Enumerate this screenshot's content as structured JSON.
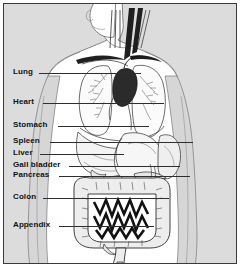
{
  "figure": {
    "background_color": "#dcdcdc",
    "body_color": "#ffffff",
    "line_color": "#2e2e2e",
    "border_color": "#3a3a3a",
    "organ_shade": "#f2f2f2",
    "heart_color": "#2b2b2b"
  },
  "labels": [
    {
      "name": "lung",
      "text": "Lung",
      "x": 12,
      "y": 67,
      "leader_start": 38,
      "leader_end": 140,
      "leader_y": 72
    },
    {
      "name": "heart",
      "text": "Heart",
      "x": 12,
      "y": 97,
      "leader_start": 42,
      "leader_end": 163,
      "leader_y": 102
    },
    {
      "name": "stomach",
      "text": "Stomach",
      "x": 12,
      "y": 120,
      "leader_start": 57,
      "leader_end": 148,
      "leader_y": 125
    },
    {
      "name": "spleen",
      "text": "Spleen",
      "x": 12,
      "y": 136,
      "leader_start": 49,
      "leader_end": 192,
      "leader_y": 141
    },
    {
      "name": "liver",
      "text": "Liver",
      "x": 12,
      "y": 148,
      "leader_start": 39,
      "leader_end": 120,
      "leader_y": 153
    },
    {
      "name": "gall-bladder",
      "text": "Gall bladder",
      "x": 12,
      "y": 160,
      "leader_start": 68,
      "leader_end": 176,
      "leader_y": 165
    },
    {
      "name": "pancreas",
      "text": "Pancreas",
      "x": 12,
      "y": 170,
      "leader_start": 58,
      "leader_end": 186,
      "leader_y": 175
    },
    {
      "name": "colon",
      "text": "Colon",
      "x": 12,
      "y": 192,
      "leader_start": 42,
      "leader_end": 165,
      "leader_y": 197
    },
    {
      "name": "appendix",
      "text": "Appendix",
      "x": 12,
      "y": 220,
      "leader_start": 58,
      "leader_end": 150,
      "leader_y": 225
    }
  ],
  "organs": [
    "head",
    "neck",
    "trachea",
    "carotid-vessels",
    "left-lung",
    "right-lung",
    "bronchial-tree",
    "heart",
    "aorta",
    "diaphragm",
    "liver",
    "stomach",
    "spleen",
    "gall-bladder",
    "pancreas",
    "ascending-colon",
    "transverse-colon",
    "descending-colon",
    "small-intestine",
    "rectum",
    "appendix",
    "torso-outline",
    "left-arm",
    "right-arm"
  ]
}
